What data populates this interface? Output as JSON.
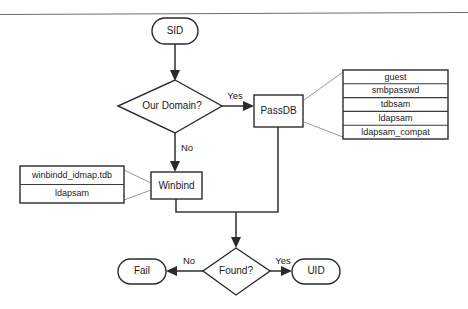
{
  "diagram": {
    "nodes": {
      "sid": "SID",
      "our_domain": "Our Domain?",
      "passdb": "PassDB",
      "winbind": "Winbind",
      "found": "Found?",
      "fail": "Fail",
      "uid": "UID"
    },
    "edge_labels": {
      "domain_yes": "Yes",
      "domain_no": "No",
      "found_no": "No",
      "found_yes": "Yes"
    },
    "passdb_backends": [
      "guest",
      "smbpasswd",
      "tdbsam",
      "ldapsam",
      "ldapsam_compat"
    ],
    "winbind_backends": [
      "winbindd_idmap.tdb",
      "ldapsam"
    ],
    "colors": {
      "stroke": "#2b2b2b",
      "connector": "#3a3a3a",
      "leader": "#8a8a8a",
      "background": "#ffffff",
      "text": "#1a1a1a"
    }
  }
}
